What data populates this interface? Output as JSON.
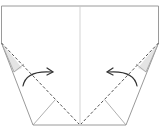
{
  "diagram": {
    "type": "origami-fold-step",
    "colors": {
      "paper": "#ffffff",
      "line": "#9a9a9a",
      "shade": "#e4e4e4",
      "arrow": "#333333"
    },
    "arrows": [
      {
        "side": "left",
        "direction": "fold-right"
      },
      {
        "side": "right",
        "direction": "fold-left"
      }
    ],
    "fold_lines": [
      {
        "side": "left",
        "style": "dashed"
      },
      {
        "side": "right",
        "style": "dashed"
      }
    ]
  }
}
